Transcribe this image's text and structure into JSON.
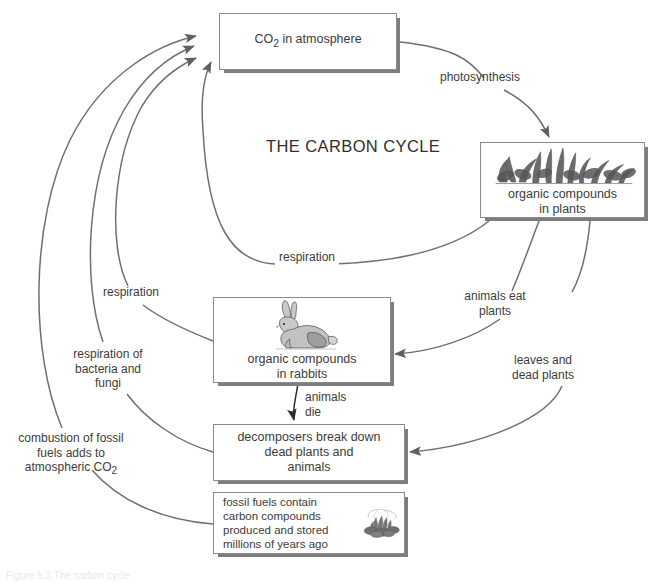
{
  "diagram": {
    "title": "THE CARBON CYCLE",
    "caption_remnant": "Figure 5.3 The carbon cycle"
  },
  "colors": {
    "line": "#6f6f6f",
    "arrow_dark": "#333333",
    "box_border": "#8a8a8a",
    "box_shadow": "#7d7d7d",
    "text": "#3b3b3b",
    "background": "#ffffff"
  },
  "boxes": {
    "co2": {
      "label": "CO",
      "subscript": "2",
      "label_tail": " in atmosphere"
    },
    "plants": {
      "line1": "organic compounds",
      "line2": "in plants",
      "art": "plants-illustration"
    },
    "rabbits": {
      "line1": "organic compounds",
      "line2": "in rabbits",
      "art": "rabbit-illustration"
    },
    "decomposers": {
      "text": "decomposers break down\ndead plants and\nanimals"
    },
    "fossil": {
      "text": "fossil fuels contain\ncarbon compounds\nproduced and stored\nmillions of years ago",
      "art": "burning-coal-illustration"
    }
  },
  "labels": {
    "photosynthesis": "photosynthesis",
    "respiration_plants": "respiration",
    "respiration_rabbits": "respiration",
    "respiration_bacteria": "respiration of\nbacteria and\nfungi",
    "combustion_pre": "combustion of fossil\nfuels adds to\natmospheric CO",
    "combustion_sub": "2",
    "animals_eat_plants": "animals eat\nplants",
    "leaves_dead_plants": "leaves and\ndead plants",
    "animals_die": "animals\ndie"
  }
}
